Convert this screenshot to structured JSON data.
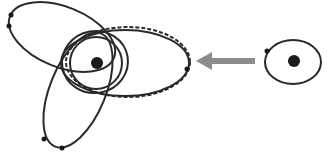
{
  "diagram": {
    "colors": {
      "stroke": "#2a2a2a",
      "body": "#1a1a1a",
      "arrow": "#8c8c8c",
      "background": "#ffffff"
    },
    "left_system": {
      "central_body": {
        "cx": 97,
        "cy": 63,
        "r": 6
      },
      "orbits": [
        {
          "name": "tilted-upper-left-orbit",
          "cx": 62,
          "cy": 37,
          "rx": 56,
          "ry": 30,
          "rotate": 22,
          "style": "solid"
        },
        {
          "name": "tilted-lower-orbit",
          "cx": 78,
          "cy": 90,
          "rx": 28,
          "ry": 61,
          "rotate": 22,
          "style": "solid"
        },
        {
          "name": "wide-horizontal-orbit",
          "cx": 125,
          "cy": 63,
          "rx": 64,
          "ry": 33,
          "rotate": 0,
          "style": "solid"
        },
        {
          "name": "dashed-wide-orbit",
          "cx": 128,
          "cy": 62,
          "rx": 62,
          "ry": 35,
          "rotate": 0,
          "style": "dashed"
        },
        {
          "name": "inner-orbit-small",
          "cx": 96,
          "cy": 63,
          "rx": 26,
          "ry": 26,
          "rotate": 0,
          "style": "solid"
        },
        {
          "name": "inner-orbit-medium",
          "cx": 95,
          "cy": 62,
          "rx": 33,
          "ry": 31,
          "rotate": -10,
          "style": "solid"
        }
      ],
      "planets": [
        {
          "cx": 11,
          "cy": 15,
          "r": 2.5
        },
        {
          "cx": 9,
          "cy": 26,
          "r": 2.5
        },
        {
          "cx": 187,
          "cy": 69,
          "r": 2.5
        },
        {
          "cx": 44,
          "cy": 139,
          "r": 2.5
        },
        {
          "cx": 62,
          "cy": 148,
          "r": 2.5
        }
      ]
    },
    "arrow": {
      "x1": 255,
      "y1": 61,
      "x2": 196,
      "y2": 61,
      "direction": "left"
    },
    "right_system": {
      "central_body": {
        "cx": 294,
        "cy": 61,
        "r": 6
      },
      "orbit": {
        "cx": 293,
        "cy": 62,
        "rx": 28,
        "ry": 22
      },
      "planet": {
        "cx": 267,
        "cy": 51,
        "r": 2.5
      }
    }
  }
}
